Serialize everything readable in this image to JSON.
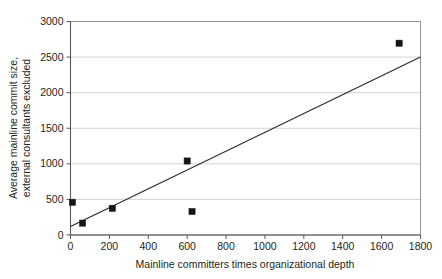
{
  "chart_data": {
    "type": "scatter",
    "title": "",
    "subtitle": "",
    "xlabel": "Mainline committers times organizational depth",
    "ylabel": "Average mainline commit size, external consultants excluded",
    "ylabel_line1": "Average mainline commit size,",
    "ylabel_line2": "external consultants excluded",
    "xlim": [
      0,
      1800
    ],
    "ylim": [
      0,
      3000
    ],
    "xticks": [
      0,
      200,
      400,
      600,
      800,
      1000,
      1200,
      1400,
      1600,
      1800
    ],
    "yticks": [
      0,
      500,
      1000,
      1500,
      2000,
      2500,
      3000
    ],
    "xtick_labels": [
      "0",
      "200",
      "400",
      "600",
      "800",
      "1000",
      "1200",
      "1400",
      "1600",
      "1800"
    ],
    "ytick_labels": [
      "0",
      "500",
      "1000",
      "1500",
      "2000",
      "2500",
      "3000"
    ],
    "grid": {
      "horizontal": true,
      "vertical": false
    },
    "legend": {
      "visible": false,
      "position": "none"
    },
    "series": [
      {
        "name": "Projects",
        "marker": "square",
        "color": "#161616",
        "points": [
          {
            "x": 10,
            "y": 460
          },
          {
            "x": 62,
            "y": 167
          },
          {
            "x": 215,
            "y": 375
          },
          {
            "x": 600,
            "y": 1040
          },
          {
            "x": 625,
            "y": 330
          },
          {
            "x": 1690,
            "y": 2695
          }
        ]
      },
      {
        "name": "Linear trend",
        "type": "line",
        "color": "#2b2b2b",
        "endpoints": [
          {
            "x": 0,
            "y": 120
          },
          {
            "x": 1800,
            "y": 2500
          }
        ]
      }
    ],
    "colors": {
      "marker": "#161616",
      "trend": "#2b2b2b",
      "grid": "#c9c9c9",
      "axis": "#585858",
      "border": "#8a8a8a",
      "text": "#231f20",
      "background": "#ffffff"
    }
  }
}
